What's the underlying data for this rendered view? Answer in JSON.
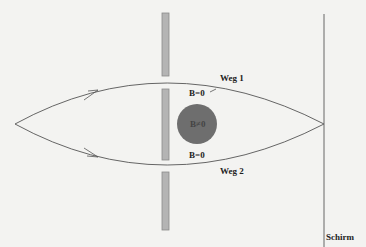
{
  "labels": {
    "path1": "Weg 1",
    "path2": "Weg 2",
    "field_top": "B=0",
    "field_center": "B≠0",
    "field_bottom": "B=0",
    "screen": "Schirm"
  },
  "colors": {
    "background": "#f3f3f1",
    "line": "#555555",
    "slit_fill": "#b4b4b4",
    "slit_stroke": "#8a8a8a",
    "field_region": "#6e6e6e"
  }
}
